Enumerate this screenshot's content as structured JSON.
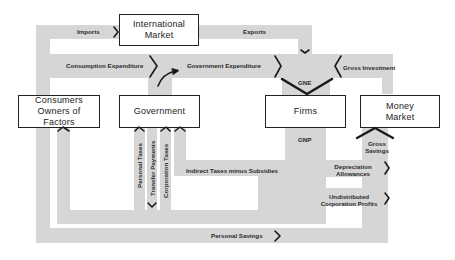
{
  "boxes": {
    "international_market": "International Market",
    "consumers": "Consumers Owners of Factors",
    "government": "Government",
    "firms": "Firms",
    "money_market": "Money Market"
  },
  "flows": {
    "imports": "Imports",
    "exports": "Exports",
    "consumption_expenditure": "Consumption Expenditure",
    "government_expenditure": "Government Expenditure",
    "gross_investment": "Gross Investment",
    "gne": "GNE",
    "gnp": "GNP",
    "personal_taxes": "Personal Taxes",
    "transfer_payments": "Transfer Payments",
    "corporation_taxes": "Corporation Taxes",
    "indirect_taxes": "Indirect Taxes minus Subsidies",
    "depreciation_line1": "Depreciation",
    "depreciation_line2": "Allowances",
    "undistributed_line1": "Undistributed",
    "undistributed_line2": "Corporation Profits",
    "gross_savings_line1": "Gross",
    "gross_savings_line2": "Savings",
    "personal_savings": "Personal Savings"
  },
  "colors": {
    "band": "#d6d6d6",
    "stroke": "#1a1a1a",
    "box_fill": "#ffffff"
  }
}
